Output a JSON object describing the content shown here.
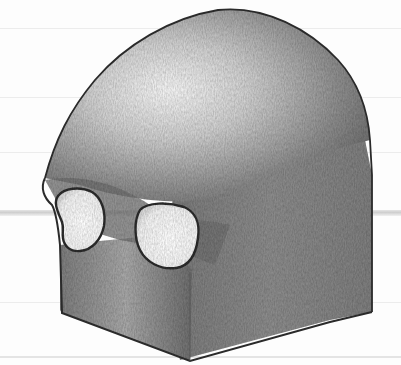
{
  "image": {
    "subject": "Pencil drawing of a simplified block-form skull with two eye sockets",
    "medium": "graphite pencil on ruled paper",
    "width": 401,
    "height": 365
  },
  "paper": {
    "background": "#fdfdfd",
    "rule_color": "#ececec",
    "rules_y": [
      28,
      97,
      152,
      302,
      356
    ],
    "band_y": 210,
    "band_color": "#c9c9c9"
  },
  "drawing": {
    "colors": {
      "outline": "#2a2a2a",
      "highlight": "#f4f4f4",
      "midtone": "#9a9a9a",
      "shadow": "#6e6e6e",
      "deep_shadow": "#4a4a4a",
      "socket_fill": "#fafafa"
    },
    "parts": [
      "cranium-dome",
      "brow-ridge",
      "left-eye-socket",
      "right-eye-socket",
      "front-face-block",
      "side-face-block"
    ]
  }
}
